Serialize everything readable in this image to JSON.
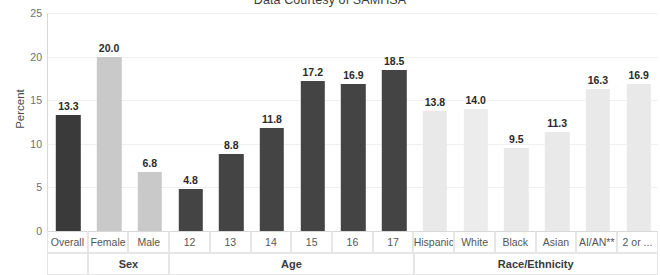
{
  "chart_data": {
    "type": "bar",
    "title": "Data Courtesy of SAMHSA",
    "xlabel": "",
    "ylabel": "Percent",
    "ylim": [
      0,
      25
    ],
    "yticks": [
      "0",
      "5",
      "10",
      "15",
      "20",
      "25"
    ],
    "grid": true,
    "legend": "none",
    "categories": [
      "Overall",
      "Female",
      "Male",
      "12",
      "13",
      "14",
      "15",
      "16",
      "17",
      "Hispanic",
      "White",
      "Black",
      "Asian",
      "AI/AN**",
      "2 or ..."
    ],
    "values": [
      13.3,
      20.0,
      6.8,
      4.8,
      8.8,
      11.8,
      17.2,
      16.9,
      18.5,
      13.8,
      14.0,
      9.5,
      11.3,
      16.3,
      16.9
    ],
    "value_labels": [
      "13.3",
      "20.0",
      "6.8",
      "4.8",
      "8.8",
      "11.8",
      "17.2",
      "16.9",
      "18.5",
      "13.8",
      "14.0",
      "9.5",
      "11.3",
      "16.3",
      "16.9"
    ],
    "bar_colors": [
      "#3a3a3a",
      "#c9c9c9",
      "#c9c9c9",
      "#444444",
      "#444444",
      "#444444",
      "#444444",
      "#444444",
      "#444444",
      "#e9e9e9",
      "#ececec",
      "#e9e9e9",
      "#e9e9e9",
      "#e9e9e9",
      "#e9e9e9"
    ],
    "groups": [
      {
        "label": "",
        "span": 1
      },
      {
        "label": "Sex",
        "span": 2
      },
      {
        "label": "Age",
        "span": 6
      },
      {
        "label": "Race/Ethnicity",
        "span": 6
      }
    ]
  },
  "colors": {
    "dark_bar": "#3a3a3a",
    "mid_bar": "#c9c9c9",
    "light_bar": "#e9e9e9",
    "axis": "#d8d8d8",
    "grid": "#f0f0f0",
    "text": "#555555"
  }
}
